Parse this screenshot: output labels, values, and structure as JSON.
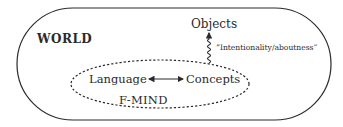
{
  "diagram": {
    "world_label": "WORLD",
    "objects_label": "Objects",
    "relation_label": "“Intentionality/aboutness”",
    "language_label": "Language",
    "concepts_label": "Concepts",
    "mind_label": "F-MIND",
    "colors": {
      "stroke": "#2a2a2a",
      "background": "#ffffff"
    }
  }
}
